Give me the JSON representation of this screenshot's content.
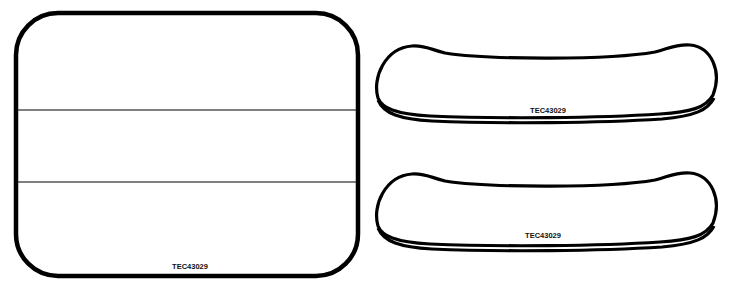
{
  "diagram": {
    "panels": [
      {
        "id": "large-panel",
        "label": "TEC43029",
        "divisions": 3
      },
      {
        "id": "curved-panel-top",
        "label": "TEC43029"
      },
      {
        "id": "curved-panel-bottom",
        "label": "TEC43029"
      }
    ]
  },
  "colors": {
    "stroke": "#000000",
    "background": "#ffffff"
  }
}
